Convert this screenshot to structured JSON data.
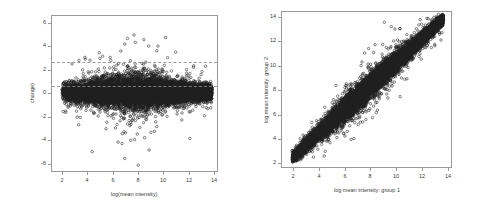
{
  "figure": {
    "background": "#ffffff",
    "frame_color": "#9a9a9a",
    "point_color": "#1a1a1a",
    "refline_color": "#8d8d8d"
  },
  "chart_data": [
    {
      "type": "scatter",
      "name": "ma-plot",
      "title": "",
      "xlabel": "log(mean intensity)",
      "ylabel": "change)",
      "xlim": [
        1.2,
        14.4
      ],
      "ylim": [
        -6.8,
        6.6
      ],
      "xticks": [
        2,
        4,
        6,
        8,
        10,
        12,
        14
      ],
      "yticks": [
        6,
        4,
        2,
        0,
        -2,
        -4,
        -6
      ],
      "xticklabels": [
        "2",
        "4",
        "6",
        "8",
        "10",
        "12",
        "14"
      ],
      "yticklabels": [
        "6",
        "4",
        "2",
        "0",
        "-2",
        "-4",
        "-6"
      ],
      "grid": false,
      "legend": "none",
      "marker": "open-circle",
      "reference_lines": [
        {
          "orientation": "horizontal",
          "y": 1,
          "style": "dashed"
        },
        {
          "orientation": "horizontal",
          "y": -1,
          "style": "dashed"
        }
      ],
      "description": "Dense black horizontal band of points centred on y=0 spanning x 2 to 14, widening scatter between x 5 and 12, sparse outliers reaching y +5 and y -5, one extreme outlier near x 8, y -6.3"
    },
    {
      "type": "scatter",
      "name": "group-comparison-plot",
      "title": "",
      "xlabel": "log mean intensity: group 1",
      "ylabel": "log mean intensity: group 2",
      "xlim": [
        1.2,
        14.6
      ],
      "ylim": [
        1.2,
        14.6
      ],
      "xticks": [
        2,
        4,
        6,
        8,
        10,
        12,
        14
      ],
      "yticks": [
        2,
        4,
        6,
        8,
        10,
        12,
        14
      ],
      "xticklabels": [
        "2",
        "4",
        "6",
        "8",
        "10",
        "12",
        "14"
      ],
      "yticklabels": [
        "2",
        "4",
        "6",
        "8",
        "10",
        "12",
        "14"
      ],
      "grid": false,
      "legend": "none",
      "marker": "open-circle",
      "reference_lines": [],
      "description": "Dense black diagonal band along the identity line y=x from (2,2) to (14,14), with grey open-circle scatter spreading a few units either side, heaviest dispersion between 4 and 11"
    }
  ],
  "panels": {
    "left": {
      "xlabel": "log(mean intensity)",
      "ylabel": "change)",
      "xticklabels": [
        "2",
        "4",
        "6",
        "8",
        "10",
        "12",
        "14"
      ],
      "yticklabels": [
        "6",
        "4",
        "2",
        "0",
        "-2",
        "-4",
        "-6"
      ]
    },
    "right": {
      "xlabel": "log mean intensity: group 1",
      "ylabel": "log mean intensity: group 2",
      "xticklabels": [
        "2",
        "4",
        "6",
        "8",
        "10",
        "12",
        "14"
      ],
      "yticklabels": [
        "14",
        "12",
        "10",
        "8",
        "6",
        "4",
        "2"
      ]
    }
  }
}
